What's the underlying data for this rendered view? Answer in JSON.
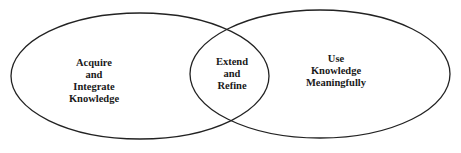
{
  "diagram": {
    "type": "venn",
    "stroke_color": "#222222",
    "background": "#ffffff",
    "left_circle": {
      "lines": [
        "Acquire",
        "and",
        "Integrate",
        "Knowledge"
      ]
    },
    "intersection": {
      "lines": [
        "Extend",
        "and",
        "Refine"
      ]
    },
    "right_circle": {
      "lines": [
        "Use",
        "Knowledge",
        "Meaningfully"
      ]
    }
  }
}
